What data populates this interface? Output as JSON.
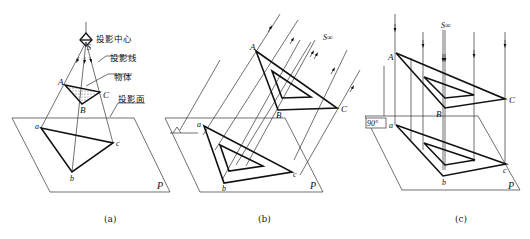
{
  "figure": {
    "panels": [
      {
        "id": "a",
        "caption": "(a)",
        "type": "central-projection",
        "labels": {
          "center": "S",
          "center_text": "投影中心",
          "rays_text": "投影线",
          "object_text": "物体",
          "plane_text": "投影面",
          "A": "A",
          "B": "B",
          "C": "C",
          "a": "a",
          "b": "b",
          "c": "c",
          "plane": "P"
        }
      },
      {
        "id": "b",
        "caption": "(b)",
        "type": "oblique-parallel-projection",
        "labels": {
          "source": "S∞",
          "A": "A",
          "B": "B",
          "C": "C",
          "a": "a",
          "b": "b",
          "c": "c",
          "plane": "P"
        }
      },
      {
        "id": "c",
        "caption": "(c)",
        "type": "orthographic-projection",
        "labels": {
          "source": "S∞",
          "angle": "90°",
          "A": "A",
          "B": "B",
          "C": "C",
          "a": "a",
          "b": "b",
          "c": "c",
          "plane": "P"
        }
      }
    ]
  }
}
